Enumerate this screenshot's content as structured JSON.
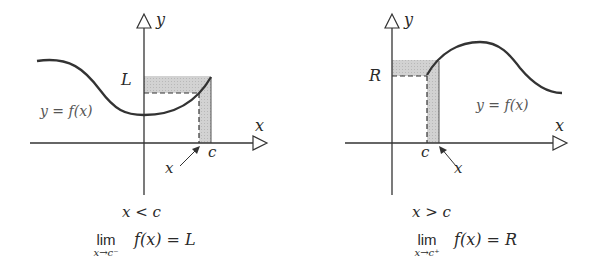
{
  "left_panel": {
    "y_axis_label": "y",
    "x_axis_label": "x",
    "limit_value_label": "L",
    "point_label": "c",
    "arrow_label": "x",
    "curve_label": "y = f(x)",
    "condition": "x < c",
    "limit": {
      "word": "lim",
      "subscript": "x→c⁻",
      "expression": "f(x) = L"
    }
  },
  "right_panel": {
    "y_axis_label": "y",
    "x_axis_label": "x",
    "limit_value_label": "R",
    "point_label": "c",
    "arrow_label": "x",
    "curve_label": "y = f(x)",
    "condition": "x > c",
    "limit": {
      "word": "lim",
      "subscript": "x→c⁺",
      "expression": "f(x) = R"
    }
  },
  "colors": {
    "stroke": "#2a2a2a",
    "shading": "#c8c8c8",
    "label_gray": "#555555"
  }
}
